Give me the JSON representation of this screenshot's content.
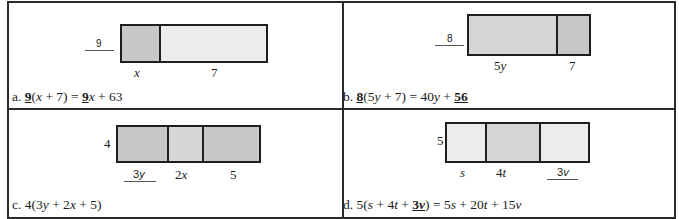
{
  "panels": {
    "a": {
      "multiplier": "9",
      "multiplier_blank": true,
      "segments": [
        {
          "label": "x",
          "italic": true,
          "shade": "dark"
        },
        {
          "label": "7",
          "italic": false,
          "shade": "light"
        }
      ],
      "equation": {
        "prefix": "a. ",
        "factor": "9",
        "inner_open": "(",
        "inner_var": "x",
        "inner_rest": " + 7)  =  ",
        "term1_coef": "9",
        "term1_var": "x",
        "tail": " + 63"
      }
    },
    "b": {
      "multiplier": "8",
      "multiplier_blank": true,
      "segments": [
        {
          "label_coef": "5",
          "label_var": "y",
          "shade": "mid"
        },
        {
          "label": "7",
          "shade": "dark"
        }
      ],
      "equation": {
        "prefix": "b. ",
        "factor": "8",
        "inner_open": "(5",
        "inner_var": "y",
        "inner_rest": " + 7)  =  40",
        "term1_var": "y",
        "plus": " + ",
        "term2": "56"
      }
    },
    "c": {
      "multiplier": "4",
      "segments": [
        {
          "label_coef": "3",
          "label_var": "y",
          "shade": "dark",
          "blank": true
        },
        {
          "label_coef": "2",
          "label_var": "x",
          "shade": "mid"
        },
        {
          "label": "5",
          "shade": "dark"
        }
      ],
      "equation": {
        "prefix": "c. 4(3",
        "v1": "y",
        "mid1": " + 2",
        "v2": "x",
        "tail": " + 5)"
      }
    },
    "d": {
      "multiplier": "5",
      "segments": [
        {
          "label": "s",
          "shade": "light"
        },
        {
          "label_coef": "4",
          "label_var": "t",
          "shade": "mid"
        },
        {
          "label_coef": "3",
          "label_var": "v",
          "shade": "light",
          "blank": true
        }
      ],
      "equation": {
        "prefix": "d. 5(",
        "v1": "s",
        "mid1": " + 4",
        "v2": "t",
        "mid2": " + ",
        "under_coef": "3",
        "under_var": "v",
        "close": ")  =  5",
        "r1": "s",
        "r2pre": " + 20",
        "r2": "t",
        "r3pre": " + 15",
        "r3": "v"
      }
    }
  },
  "colors": {
    "border": "#2a2a2a",
    "dark_shade": "#c8c8c8",
    "mid_shade": "#d6d6d6",
    "light_shade": "#ececec"
  }
}
